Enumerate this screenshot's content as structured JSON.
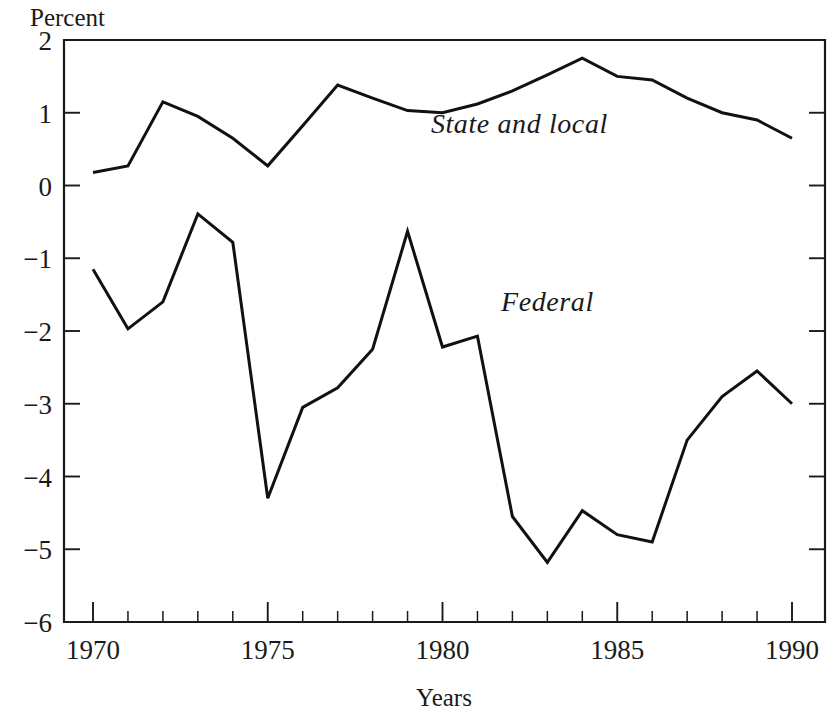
{
  "chart_data": {
    "type": "line",
    "title": "",
    "xlabel": "Years",
    "ylabel": "Percent",
    "ylabel_position": "top-left",
    "xlim": [
      1970,
      1990
    ],
    "ylim": [
      -6,
      2
    ],
    "grid": false,
    "legend_position": "inline-annotations",
    "x_tick_labels": [
      "1970",
      "1975",
      "1980",
      "1985",
      "1990"
    ],
    "x_major_ticks": [
      1970,
      1975,
      1980,
      1985,
      1990
    ],
    "x_minor_tick_interval": 1,
    "y_tick_labels": [
      "2",
      "1",
      "0",
      "−1",
      "−2",
      "−3",
      "−4",
      "−5",
      "−6"
    ],
    "y_major_ticks": [
      2,
      1,
      0,
      -1,
      -2,
      -3,
      -4,
      -5,
      -6
    ],
    "x": [
      1970,
      1971,
      1972,
      1973,
      1974,
      1975,
      1976,
      1977,
      1978,
      1979,
      1980,
      1981,
      1982,
      1983,
      1984,
      1985,
      1986,
      1987,
      1988,
      1989,
      1990
    ],
    "series": [
      {
        "name": "State and local",
        "label_x": 1982.2,
        "label_y": 0.72,
        "values": [
          0.18,
          0.27,
          1.15,
          0.95,
          0.65,
          0.27,
          0.82,
          1.38,
          1.2,
          1.03,
          1.0,
          1.12,
          1.3,
          1.52,
          1.75,
          1.5,
          1.45,
          1.2,
          1.0,
          0.9,
          0.65
        ]
      },
      {
        "name": "Federal",
        "label_x": 1983.0,
        "label_y": -1.72,
        "values": [
          -1.15,
          -1.97,
          -1.6,
          -0.39,
          -0.78,
          -4.3,
          -3.05,
          -2.78,
          -2.25,
          -0.63,
          -2.22,
          -2.07,
          -4.55,
          -5.18,
          -4.47,
          -4.8,
          -4.9,
          -3.5,
          -2.9,
          -2.55,
          -3.0
        ]
      }
    ]
  }
}
